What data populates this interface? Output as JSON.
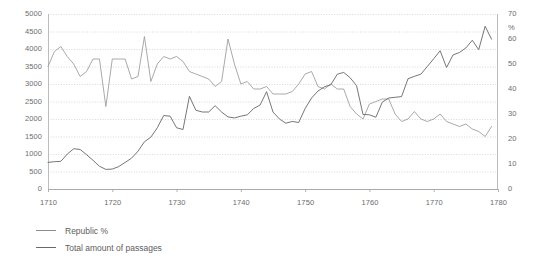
{
  "chart_data": {
    "type": "line",
    "title": "",
    "subtitle": "",
    "xlabel": "",
    "ylabel": "",
    "y2label": "%",
    "grid": true,
    "legend_position": "bottom-left",
    "xlim": [
      1710,
      1780
    ],
    "ylim": [
      0,
      5000
    ],
    "y2lim": [
      0,
      70
    ],
    "xticks": [
      1710,
      1720,
      1730,
      1740,
      1750,
      1760,
      1770,
      1780
    ],
    "yticks": [
      0,
      500,
      1000,
      1500,
      2000,
      2500,
      3000,
      3500,
      4000,
      4500,
      5000
    ],
    "y2ticks": [
      0,
      10,
      20,
      30,
      40,
      50,
      60,
      70
    ],
    "xtick_labels": [
      "1710",
      "1720",
      "1730",
      "1740",
      "1750",
      "1760",
      "1770",
      "1780"
    ],
    "ytick_labels": [
      "0",
      "500",
      "1000",
      "1500",
      "2000",
      "2500",
      "3000",
      "3500",
      "4000",
      "4500",
      "5000"
    ],
    "y2tick_labels": [
      "0",
      "10",
      "20",
      "30",
      "40",
      "50",
      "60",
      "70"
    ],
    "x": [
      1710,
      1711,
      1712,
      1713,
      1714,
      1715,
      1716,
      1717,
      1718,
      1719,
      1720,
      1721,
      1722,
      1723,
      1724,
      1725,
      1726,
      1727,
      1728,
      1729,
      1730,
      1731,
      1732,
      1733,
      1734,
      1735,
      1736,
      1737,
      1738,
      1739,
      1740,
      1741,
      1742,
      1743,
      1744,
      1745,
      1746,
      1747,
      1748,
      1749,
      1750,
      1751,
      1752,
      1753,
      1754,
      1755,
      1756,
      1757,
      1758,
      1759,
      1760,
      1761,
      1762,
      1763,
      1764,
      1765,
      1766,
      1767,
      1768,
      1769,
      1770,
      1771,
      1772,
      1773,
      1774,
      1775,
      1776,
      1777,
      1778,
      1779
    ],
    "series": [
      {
        "name": "Republic %",
        "axis": "right",
        "unit": "%",
        "color": "#9a9a9a",
        "values": [
          49,
          55,
          57,
          53,
          50,
          45,
          47,
          52,
          52,
          33,
          52,
          52,
          52,
          44,
          45,
          61,
          43,
          50,
          53,
          52,
          53,
          51,
          47,
          46,
          45,
          44,
          41,
          43,
          60,
          50,
          42,
          43,
          40,
          40,
          41,
          38,
          38,
          38,
          39,
          42,
          46,
          47,
          41,
          40,
          42,
          40,
          40,
          33,
          30,
          28,
          34,
          35,
          36,
          36,
          30,
          27,
          28,
          31,
          28,
          27,
          28,
          30,
          27,
          26,
          25,
          26,
          24,
          23,
          21,
          25
        ]
      },
      {
        "name": "Total amount of passages",
        "axis": "left",
        "unit": "passages",
        "color": "#6f6f6f",
        "values": [
          760,
          780,
          790,
          1000,
          1150,
          1130,
          980,
          820,
          650,
          560,
          570,
          640,
          760,
          880,
          1080,
          1350,
          1480,
          1750,
          2100,
          2080,
          1750,
          1700,
          2650,
          2250,
          2200,
          2200,
          2380,
          2200,
          2060,
          2030,
          2080,
          2120,
          2300,
          2400,
          2780,
          2200,
          2000,
          1880,
          1930,
          1900,
          2300,
          2600,
          2800,
          2920,
          2980,
          3280,
          3330,
          3180,
          2950,
          2130,
          2120,
          2050,
          2480,
          2600,
          2620,
          2640,
          3150,
          3220,
          3280,
          3500,
          3720,
          3950,
          3470,
          3830,
          3900,
          4030,
          4250,
          3980,
          4650,
          4280
        ]
      }
    ],
    "annotations": []
  },
  "legend": {
    "items": [
      {
        "label": "Republic %",
        "color": "#9a9a9a"
      },
      {
        "label": "Total amount of passages",
        "color": "#6f6f6f"
      }
    ]
  }
}
